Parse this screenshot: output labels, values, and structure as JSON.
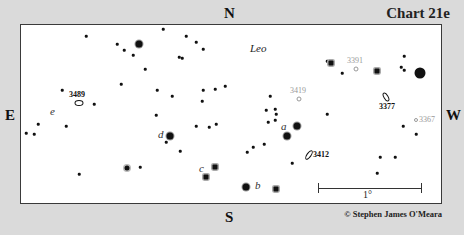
{
  "chart": {
    "title": "Chart 21e",
    "credit": "© Stephen James O'Meara",
    "constellation": "Leo",
    "directions": {
      "north": "N",
      "south": "S",
      "east": "E",
      "west": "W"
    },
    "scale_label": "1°"
  },
  "stars": [
    {
      "x": 86,
      "y": 36,
      "s": "s1"
    },
    {
      "x": 117,
      "y": 44,
      "s": "s1"
    },
    {
      "x": 124,
      "y": 50,
      "s": "s1"
    },
    {
      "x": 139,
      "y": 44,
      "s": "s3"
    },
    {
      "x": 133,
      "y": 55,
      "s": "s1"
    },
    {
      "x": 163,
      "y": 29,
      "s": "s1"
    },
    {
      "x": 186,
      "y": 36,
      "s": "s1"
    },
    {
      "x": 196,
      "y": 42,
      "s": "s1"
    },
    {
      "x": 203,
      "y": 49,
      "s": "s1"
    },
    {
      "x": 179,
      "y": 57,
      "s": "s1"
    },
    {
      "x": 182,
      "y": 58,
      "s": "s1"
    },
    {
      "x": 145,
      "y": 69,
      "s": "s1"
    },
    {
      "x": 121,
      "y": 84,
      "s": "s1"
    },
    {
      "x": 157,
      "y": 90,
      "s": "s1"
    },
    {
      "x": 172,
      "y": 96,
      "s": "s1"
    },
    {
      "x": 203,
      "y": 90,
      "s": "s1"
    },
    {
      "x": 215,
      "y": 89,
      "s": "s1"
    },
    {
      "x": 225,
      "y": 86,
      "s": "s1"
    },
    {
      "x": 202,
      "y": 101,
      "s": "s1"
    },
    {
      "x": 62,
      "y": 90,
      "s": "s1"
    },
    {
      "x": 94,
      "y": 104,
      "s": "s1"
    },
    {
      "x": 156,
      "y": 115,
      "s": "s1"
    },
    {
      "x": 38,
      "y": 124,
      "s": "s1"
    },
    {
      "x": 26,
      "y": 133,
      "s": "s1"
    },
    {
      "x": 34,
      "y": 134,
      "s": "s1"
    },
    {
      "x": 66,
      "y": 126,
      "s": "s1"
    },
    {
      "x": 196,
      "y": 126,
      "s": "s1"
    },
    {
      "x": 209,
      "y": 127,
      "s": "s1"
    },
    {
      "x": 216,
      "y": 124,
      "s": "s1"
    },
    {
      "x": 170,
      "y": 136,
      "s": "s3"
    },
    {
      "x": 166,
      "y": 142,
      "s": "s1"
    },
    {
      "x": 180,
      "y": 151,
      "s": "s1"
    },
    {
      "x": 140,
      "y": 167,
      "s": "s1"
    },
    {
      "x": 127,
      "y": 168,
      "s": "s2"
    },
    {
      "x": 79,
      "y": 174,
      "s": "s1"
    },
    {
      "x": 215,
      "y": 167,
      "s": "sq"
    },
    {
      "x": 206,
      "y": 177,
      "s": "sq"
    },
    {
      "x": 246,
      "y": 187,
      "s": "s3"
    },
    {
      "x": 276,
      "y": 189,
      "s": "sq"
    },
    {
      "x": 270,
      "y": 96,
      "s": "s1"
    },
    {
      "x": 266,
      "y": 110,
      "s": "s1"
    },
    {
      "x": 275,
      "y": 109,
      "s": "s1"
    },
    {
      "x": 268,
      "y": 122,
      "s": "s1"
    },
    {
      "x": 275,
      "y": 120,
      "s": "s1"
    },
    {
      "x": 276,
      "y": 114,
      "s": "s1"
    },
    {
      "x": 297,
      "y": 126,
      "s": "s3"
    },
    {
      "x": 287,
      "y": 136,
      "s": "s3"
    },
    {
      "x": 247,
      "y": 152,
      "s": "s1"
    },
    {
      "x": 253,
      "y": 147,
      "s": "s1"
    },
    {
      "x": 264,
      "y": 144,
      "s": "s1"
    },
    {
      "x": 292,
      "y": 163,
      "s": "s1"
    },
    {
      "x": 327,
      "y": 61,
      "s": "s1"
    },
    {
      "x": 331,
      "y": 63,
      "s": "sq"
    },
    {
      "x": 342,
      "y": 73,
      "s": "s1"
    },
    {
      "x": 377,
      "y": 71,
      "s": "sq"
    },
    {
      "x": 404,
      "y": 56,
      "s": "s1"
    },
    {
      "x": 401,
      "y": 67,
      "s": "s1"
    },
    {
      "x": 404,
      "y": 70,
      "s": "s1"
    },
    {
      "x": 420,
      "y": 73,
      "s": "s4"
    },
    {
      "x": 327,
      "y": 114,
      "s": "s1"
    },
    {
      "x": 403,
      "y": 126,
      "s": "s1"
    },
    {
      "x": 416,
      "y": 134,
      "s": "s1"
    },
    {
      "x": 380,
      "y": 157,
      "s": "s1"
    },
    {
      "x": 395,
      "y": 157,
      "s": "s1"
    },
    {
      "x": 377,
      "y": 173,
      "s": "s1"
    }
  ],
  "galaxies": [
    {
      "id": "3489",
      "x": 79,
      "y": 103,
      "w": 9,
      "h": 6,
      "rot": 0,
      "style": "bold",
      "label": {
        "text": "3489",
        "x": 69,
        "y": 90,
        "cls": "bold"
      }
    },
    {
      "id": "3391",
      "x": 356,
      "y": 69,
      "w": 5,
      "h": 5,
      "rot": 0,
      "style": "faint",
      "label": {
        "text": "3391",
        "x": 347,
        "y": 56,
        "cls": "faint"
      }
    },
    {
      "id": "3419",
      "x": 299,
      "y": 99,
      "w": 5,
      "h": 5,
      "rot": 0,
      "style": "faint",
      "label": {
        "text": "3419",
        "x": 290,
        "y": 86,
        "cls": "faint"
      }
    },
    {
      "id": "3377",
      "x": 386,
      "y": 97,
      "w": 5,
      "h": 10,
      "rot": -30,
      "style": "bold",
      "label": {
        "text": "3377",
        "x": 379,
        "y": 102,
        "cls": "bold"
      }
    },
    {
      "id": "3367",
      "x": 416,
      "y": 120,
      "w": 4,
      "h": 4,
      "rot": 0,
      "style": "faint",
      "label": {
        "text": "3367",
        "x": 419,
        "y": 115,
        "cls": "faint"
      }
    },
    {
      "id": "3412",
      "x": 309,
      "y": 155,
      "w": 5,
      "h": 11,
      "rot": 35,
      "style": "bold",
      "label": {
        "text": "3412",
        "x": 313,
        "y": 150,
        "cls": "bold"
      }
    }
  ],
  "star_labels": [
    {
      "text": "e",
      "x": 50,
      "y": 105
    },
    {
      "text": "d",
      "x": 158,
      "y": 128
    },
    {
      "text": "c",
      "x": 199,
      "y": 162
    },
    {
      "text": "a",
      "x": 281,
      "y": 120
    },
    {
      "text": "b",
      "x": 255,
      "y": 179
    }
  ],
  "scale_bar": {
    "x1": 318,
    "x2": 421,
    "y": 188
  }
}
